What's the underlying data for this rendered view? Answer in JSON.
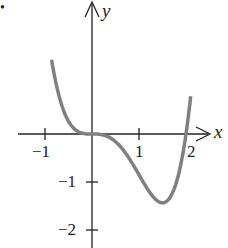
{
  "bullet": "•",
  "chart_data": {
    "type": "line",
    "title": "",
    "xlabel": "x",
    "ylabel": "y",
    "function": "y = x^4 - 2x^3",
    "xlim": [
      -1.1,
      2.4
    ],
    "ylim": [
      -2.3,
      2.8
    ],
    "x_ticks": [
      "-1",
      "1",
      "2"
    ],
    "y_ticks": [
      "-1",
      "-2"
    ],
    "series": [
      {
        "name": "curve",
        "color": "#808080",
        "x": [
          -0.95,
          -0.75,
          -0.5,
          -0.25,
          0,
          0.5,
          1,
          1.5,
          1.75,
          2,
          2.1
        ],
        "y": [
          2.53,
          1.16,
          0.31,
          0.035,
          0,
          -0.19,
          -1.0,
          -1.69,
          -1.34,
          0,
          0.93
        ]
      }
    ],
    "grid": false
  }
}
